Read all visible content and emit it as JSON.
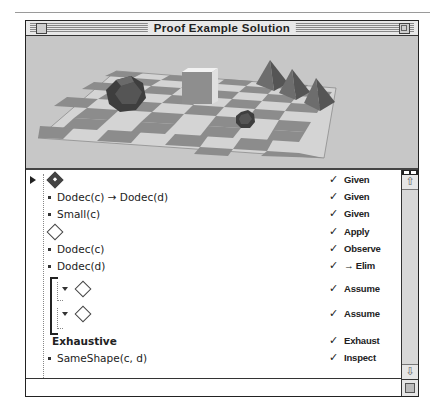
{
  "window": {
    "title": "Proof Example Solution"
  },
  "scene": {
    "objects": [
      {
        "shape": "dodecahedron",
        "size": "large"
      },
      {
        "shape": "cube",
        "size": "large"
      },
      {
        "shape": "tetrahedron",
        "size": "medium"
      },
      {
        "shape": "tetrahedron",
        "size": "medium"
      },
      {
        "shape": "tetrahedron",
        "size": "medium"
      },
      {
        "shape": "dodecahedron",
        "size": "small"
      }
    ]
  },
  "proof": {
    "steps": [
      {
        "icon": "diamond-filled-icon",
        "text": "",
        "check": "✓",
        "rule": "Given"
      },
      {
        "icon": "bullet",
        "text": "Dodec(c) → Dodec(d)",
        "check": "✓",
        "rule": "Given"
      },
      {
        "icon": "bullet",
        "text": "Small(c)",
        "check": "✓",
        "rule": "Given"
      },
      {
        "icon": "diamond-icon",
        "text": "",
        "check": "✓",
        "rule": "Apply"
      },
      {
        "icon": "bullet",
        "text": "Dodec(c)",
        "check": "✓",
        "rule": "Observe"
      },
      {
        "icon": "bullet",
        "text": "Dodec(d)",
        "check": "✓",
        "rule": "→ Elim"
      },
      {
        "icon": "diamond-icon",
        "text": "",
        "check": "✓",
        "rule": "Assume"
      },
      {
        "icon": "diamond-icon",
        "text": "",
        "check": "✓",
        "rule": "Assume"
      },
      {
        "icon": "none",
        "text": "Exhaustive",
        "check": "✓",
        "rule": "Exhaust"
      },
      {
        "icon": "bullet",
        "text": "SameShape(c, d)",
        "check": "✓",
        "rule": "Inspect"
      }
    ]
  },
  "scrollbar": {
    "up_arrow": "⇧",
    "down_arrow": "⇩"
  }
}
